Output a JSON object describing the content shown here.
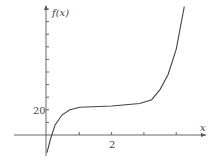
{
  "chart_data": {
    "type": "line",
    "title": "",
    "xlabel": "x",
    "ylabel": "f(x)",
    "x_ticks": [
      1,
      2,
      3,
      4
    ],
    "x_tick_labels": [
      "",
      "2",
      "",
      ""
    ],
    "y_ticks": [
      10,
      20,
      30,
      40,
      50,
      60,
      70,
      80,
      90,
      100
    ],
    "y_tick_labels": [
      "",
      "20",
      "",
      "",
      "",
      "",
      "",
      "",
      "",
      ""
    ],
    "grid": false,
    "series": [
      {
        "name": "f(x)",
        "x": [
          0.0,
          0.1,
          0.25,
          0.47,
          0.71,
          1.02,
          2.0,
          2.87,
          3.24,
          3.5,
          3.75,
          4.0,
          4.25
        ],
        "values": [
          -14,
          -4,
          8,
          16,
          20,
          22,
          23,
          25,
          28,
          36,
          48,
          68,
          102
        ]
      }
    ],
    "xlim": [
      -0.4,
      5.1
    ],
    "ylim": [
      -22,
      108
    ]
  },
  "labels": {
    "y_axis": "f(x)",
    "x_axis": "x",
    "y_tick_20": "20",
    "x_tick_2": "2"
  }
}
